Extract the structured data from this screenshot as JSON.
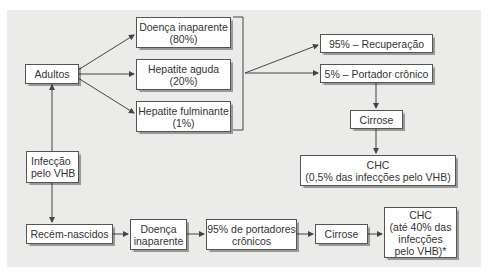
{
  "diagram": {
    "nodes": {
      "adultos": "Adultos",
      "infeccao": "Infecção\npelo VHB",
      "recem_nascidos": "Recém-nascidos",
      "doenca_inaparente_adultos": "Doença inaparente\n(80%)",
      "hepatite_aguda": "Hepatite aguda\n(20%)",
      "hepatite_fulminante": "Hepatite fulminante\n(1%)",
      "recuperacao": "95% – Recuperação",
      "portador_cronico": "5% – Portador crônico",
      "cirrose_adultos": "Cirrose",
      "chc_adultos": "CHC\n(0,5% das infecções pelo VHB)",
      "doenca_inaparente_rn": "Doença\ninaparente",
      "portadores_cronicos_rn": "95% de portadores\ncrônicos",
      "cirrose_rn": "Cirrose",
      "chc_rn": "CHC\n(até 40% das\ninfecções\npelo VHB)*"
    },
    "colors": {
      "background_panel": "#ebebea",
      "box_fill": "#ffffff",
      "line": "#444444",
      "text": "#333333"
    }
  }
}
